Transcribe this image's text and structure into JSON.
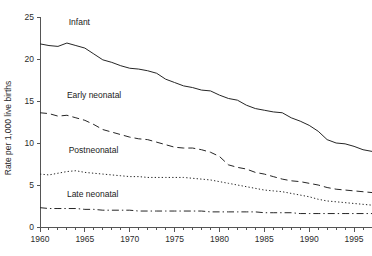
{
  "chart_data": {
    "type": "line",
    "title": "",
    "subtitle": "",
    "xlabel": "",
    "ylabel": "Rate per 1,000 live births",
    "xlim": [
      1960,
      1997
    ],
    "ylim": [
      0,
      25
    ],
    "grid": false,
    "legend_position": "inline-labels",
    "x_ticks": [
      1960,
      1965,
      1970,
      1975,
      1980,
      1985,
      1990,
      1995
    ],
    "x_tick_labels": [
      "1960",
      "1965",
      "1970",
      "1975",
      "1980",
      "1985",
      "1990",
      "1995"
    ],
    "x_minor_ticks": [
      1961,
      1962,
      1963,
      1964,
      1966,
      1967,
      1968,
      1969,
      1971,
      1972,
      1973,
      1974,
      1976,
      1977,
      1978,
      1979,
      1981,
      1982,
      1983,
      1984,
      1986,
      1987,
      1988,
      1989,
      1991,
      1992,
      1993,
      1994,
      1996,
      1997
    ],
    "y_ticks": [
      0,
      5,
      10,
      15,
      20,
      25
    ],
    "y_tick_labels": [
      "0",
      "5",
      "10",
      "15",
      "20",
      "25"
    ],
    "x": [
      1960,
      1961,
      1962,
      1963,
      1964,
      1965,
      1966,
      1967,
      1968,
      1969,
      1970,
      1971,
      1972,
      1973,
      1974,
      1975,
      1976,
      1977,
      1978,
      1979,
      1980,
      1981,
      1982,
      1983,
      1984,
      1985,
      1986,
      1987,
      1988,
      1989,
      1990,
      1991,
      1992,
      1993,
      1994,
      1995,
      1996,
      1997
    ],
    "series": [
      {
        "name": "Infant",
        "line_style": "solid",
        "color": "#262626",
        "label_x": 1963.2,
        "label_y": 24.0,
        "values": [
          21.8,
          21.6,
          21.5,
          21.9,
          21.6,
          21.3,
          20.6,
          19.9,
          19.6,
          19.2,
          18.9,
          18.8,
          18.6,
          18.3,
          17.6,
          17.2,
          16.8,
          16.6,
          16.3,
          16.2,
          15.7,
          15.3,
          15.1,
          14.5,
          14.1,
          13.9,
          13.7,
          13.6,
          13.0,
          12.6,
          12.1,
          11.4,
          10.4,
          10.0,
          9.9,
          9.6,
          9.2,
          9.0
        ]
      },
      {
        "name": "Early neonatal",
        "line_style": "dashed",
        "color": "#262626",
        "label_x": 1963.0,
        "label_y": 15.3,
        "values": [
          13.6,
          13.5,
          13.2,
          13.3,
          13.0,
          12.7,
          12.2,
          11.6,
          11.3,
          11.0,
          10.7,
          10.5,
          10.4,
          10.1,
          9.8,
          9.5,
          9.4,
          9.4,
          9.2,
          8.9,
          8.4,
          7.4,
          7.1,
          6.9,
          6.5,
          6.3,
          6.0,
          5.7,
          5.5,
          5.4,
          5.2,
          5.0,
          4.7,
          4.5,
          4.4,
          4.3,
          4.2,
          4.1
        ]
      },
      {
        "name": "Postneonatal",
        "line_style": "dotted",
        "color": "#262626",
        "label_x": 1963.2,
        "label_y": 8.8,
        "values": [
          6.3,
          6.2,
          6.4,
          6.6,
          6.7,
          6.5,
          6.4,
          6.3,
          6.2,
          6.1,
          6.0,
          6.0,
          5.9,
          5.9,
          5.9,
          5.9,
          5.9,
          5.8,
          5.7,
          5.6,
          5.4,
          5.2,
          5.0,
          4.8,
          4.6,
          4.4,
          4.3,
          4.2,
          4.0,
          3.8,
          3.6,
          3.3,
          3.1,
          3.0,
          2.9,
          2.8,
          2.7,
          2.6
        ]
      },
      {
        "name": "Late neonatal",
        "line_style": "dashdot",
        "color": "#262626",
        "label_x": 1963.0,
        "label_y": 3.6,
        "values": [
          2.3,
          2.2,
          2.2,
          2.2,
          2.2,
          2.1,
          2.1,
          2.0,
          2.0,
          2.0,
          2.0,
          1.9,
          1.9,
          1.9,
          1.9,
          1.9,
          1.9,
          1.9,
          1.9,
          1.8,
          1.8,
          1.8,
          1.8,
          1.8,
          1.8,
          1.7,
          1.7,
          1.7,
          1.7,
          1.6,
          1.6,
          1.6,
          1.6,
          1.6,
          1.6,
          1.6,
          1.6,
          1.6
        ]
      }
    ]
  }
}
